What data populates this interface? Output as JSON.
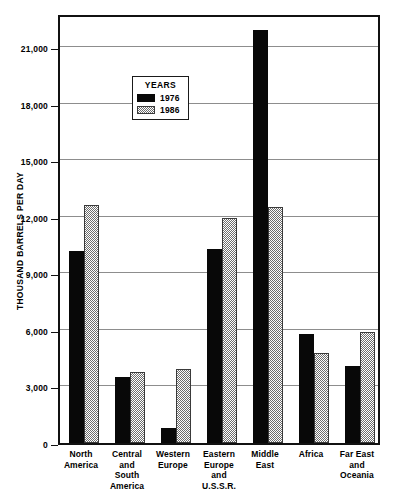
{
  "chart_data": {
    "type": "bar",
    "title": "",
    "xlabel": "",
    "ylabel": "THOUSAND BARRELS PER DAY",
    "ylim": [
      0,
      22800
    ],
    "yticks": [
      0,
      3000,
      6000,
      9000,
      12000,
      15000,
      18000,
      21000
    ],
    "ytick_labels": [
      "0",
      "3,000",
      "6,000",
      "9,000",
      "12,000",
      "15,000",
      "18,000",
      "21,000"
    ],
    "grid": true,
    "legend_title": "YEARS",
    "legend_position": "inside-upper-center",
    "categories": [
      "North\nAmerica",
      "Central\nand\nSouth\nAmerica",
      "Western\nEurope",
      "Eastern\nEurope\nand\nU.S.S.R.",
      "Middle\nEast",
      "Africa",
      "Far East\nand\nOceania"
    ],
    "series": [
      {
        "name": "1976",
        "color": "#080808",
        "values": [
          10200,
          3500,
          800,
          10300,
          21900,
          5800,
          4100
        ]
      },
      {
        "name": "1986",
        "color": "#6e6e6e",
        "values": [
          12600,
          3750,
          3900,
          11950,
          12500,
          4750,
          5900
        ]
      }
    ]
  }
}
